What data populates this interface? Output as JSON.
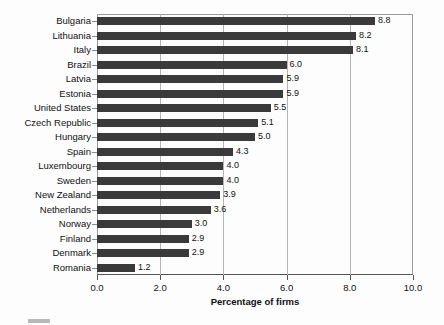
{
  "chart_data": {
    "type": "bar",
    "orientation": "horizontal",
    "title": "",
    "xlabel": "Percentage of firms",
    "ylabel": "",
    "xlim": [
      0.0,
      10.0
    ],
    "xticks": [
      "0.0",
      "2.0",
      "4.0",
      "6.0",
      "8.0",
      "10.0"
    ],
    "xtick_values": [
      0.0,
      2.0,
      4.0,
      6.0,
      8.0,
      10.0
    ],
    "grid": "vertical",
    "legend": "none",
    "bar_color": "#3a3a3a",
    "gridline_color": "#b4b4b4",
    "categories": [
      "Bulgaria",
      "Lithuania",
      "Italy",
      "Brazil",
      "Latvia",
      "Estonia",
      "United States",
      "Czech Republic",
      "Hungary",
      "Spain",
      "Luxembourg",
      "Sweden",
      "New Zealand",
      "Netherlands",
      "Norway",
      "Finland",
      "Denmark",
      "Romania"
    ],
    "values": [
      8.8,
      8.2,
      8.1,
      6.0,
      5.9,
      5.9,
      5.5,
      5.1,
      5.0,
      4.3,
      4.0,
      4.0,
      3.9,
      3.6,
      3.0,
      2.9,
      2.9,
      1.2
    ],
    "value_labels": [
      "8.8",
      "8.2",
      "8.1",
      "6.0",
      "5.9",
      "5.9",
      "5.5",
      "5.1",
      "5.0",
      "4.3",
      "4.0",
      "4.0",
      "3.9",
      "3.6",
      "3.0",
      "2.9",
      "2.9",
      "1.2"
    ]
  }
}
